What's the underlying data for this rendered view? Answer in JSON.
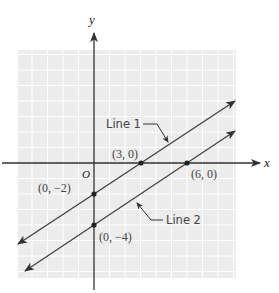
{
  "diagram": {
    "type": "coordinate-plane",
    "colors": {
      "grid_background": "#ececec",
      "grid_lines": "#ffffff",
      "axes": "#333333",
      "lines": "#444444",
      "points": "#222222",
      "text": "#444444"
    },
    "axes": {
      "x_label": "x",
      "y_label": "y",
      "origin_label": "O"
    },
    "lines": [
      {
        "name": "Line 1",
        "label": "Line 1",
        "equation": "y = (2/3)x - 2",
        "points": [
          {
            "x": 0,
            "y": -2,
            "label": "(0, −2)"
          },
          {
            "x": 3,
            "y": 0,
            "label": "(3, 0)"
          }
        ]
      },
      {
        "name": "Line 2",
        "label": "Line 2",
        "equation": "y = (2/3)x - 4",
        "points": [
          {
            "x": 0,
            "y": -4,
            "label": "(0, −4)"
          },
          {
            "x": 6,
            "y": 0,
            "label": "(6, 0)"
          }
        ]
      }
    ],
    "point_labels": {
      "p_3_0": "(3, 0)",
      "p_6_0": "(6, 0)",
      "p_0_m2": "(0, −2)",
      "p_0_m4": "(0, −4)"
    },
    "line_labels": {
      "line1": "Line 1",
      "line2": "Line 2"
    }
  }
}
